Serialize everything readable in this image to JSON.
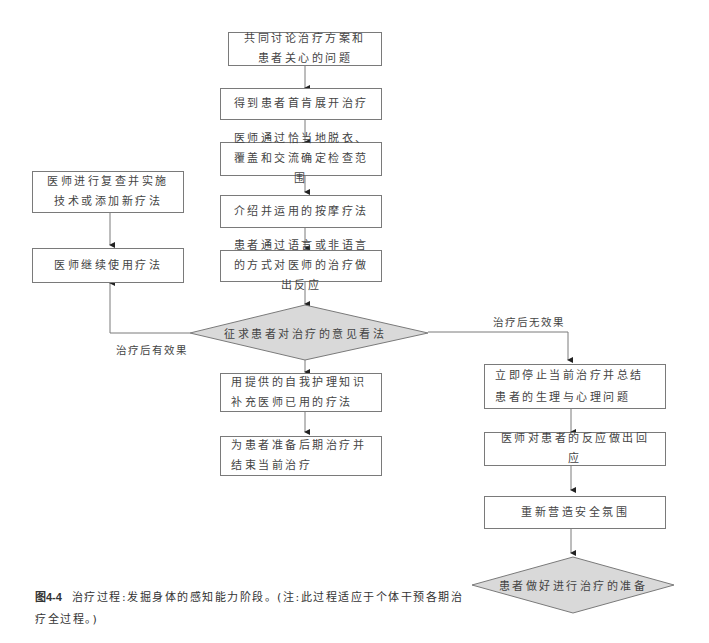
{
  "flowchart": {
    "steps": [
      {
        "id": "s1",
        "text": "共同讨论治疗方案和患者关心的问题"
      },
      {
        "id": "s2",
        "text": "得到患者首肯展开治疗"
      },
      {
        "id": "s3",
        "text": "医师通过恰当地脱衣、覆盖和交流确定检查范围"
      },
      {
        "id": "s4",
        "text": "介绍并运用的按摩疗法"
      },
      {
        "id": "s5",
        "text": "患者通过语言或非语言的方式对医师的治疗做出反应"
      }
    ],
    "decision": {
      "text": "征求患者对治疗的意见看法"
    },
    "left_branch": {
      "label": "治疗后有效果",
      "steps": [
        {
          "id": "l1",
          "text": "医师进行复查并实施技术或添加新疗法"
        },
        {
          "id": "l2",
          "text": "医师继续使用疗法"
        }
      ]
    },
    "middle_branch": {
      "steps": [
        {
          "id": "m1",
          "text": "用提供的自我护理知识补充医师已用的疗法"
        },
        {
          "id": "m2",
          "text": "为患者准备后期治疗并结束当前治疗"
        }
      ]
    },
    "right_branch": {
      "label": "治疗后无效果",
      "steps": [
        {
          "id": "r1",
          "text": "立即停止当前治疗并总结患者的生理与心理问题"
        },
        {
          "id": "r2",
          "text": "医师对患者的反应做出回应"
        },
        {
          "id": "r3",
          "text": "重新营造安全氛围"
        }
      ],
      "end": {
        "text": "患者做好进行治疗的准备"
      }
    }
  },
  "caption": {
    "figure_number": "图4-4",
    "text": "治疗过程:发掘身体的感知能力阶段。(注:此过程适应于个体干预各期治疗全过程。)"
  },
  "colors": {
    "line": "#7a7a7a",
    "decision_fill": "#d9d9d9"
  }
}
